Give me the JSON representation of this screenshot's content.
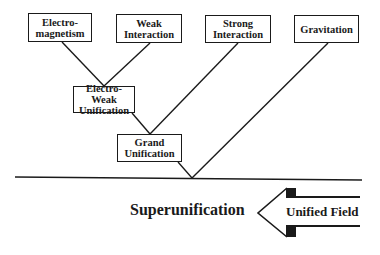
{
  "diagram": {
    "forces": [
      {
        "id": "em",
        "label": "Electro-\nmagnetism"
      },
      {
        "id": "weak",
        "label": "Weak\nInteraction"
      },
      {
        "id": "strong",
        "label": "Strong\nInteraction"
      },
      {
        "id": "gravity",
        "label": "Gravitation"
      }
    ],
    "unifications": [
      {
        "id": "electroweak",
        "label": "Electro-Weak\nUnification"
      },
      {
        "id": "grand",
        "label": "Grand\nUnification"
      }
    ],
    "superunification_label": "Superunification",
    "arrow_label": "Unified Field",
    "colors": {
      "line": "#1a1a1a",
      "background": "#ffffff"
    }
  }
}
